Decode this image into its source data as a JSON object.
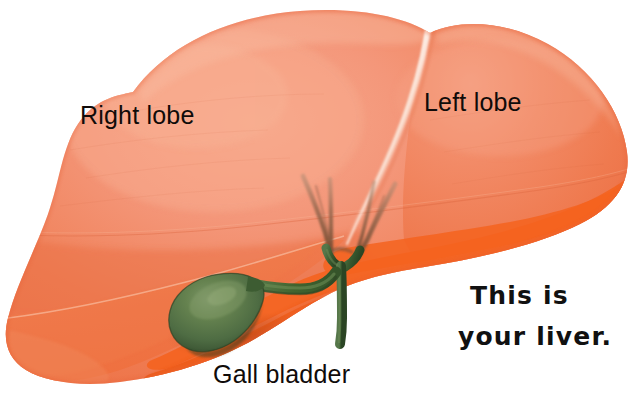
{
  "illustration": {
    "subject": "human liver anatomy",
    "background_color": "#ffffff",
    "labels": {
      "right_lobe": "Right lobe",
      "left_lobe": "Left lobe",
      "gall_bladder": "Gall bladder"
    },
    "caption": {
      "line1": "This is",
      "line2": "your liver."
    },
    "colors": {
      "liver_light": "#f4977a",
      "liver_main": "#f0815a",
      "liver_mid": "#ef7347",
      "liver_shadow": "#e56840",
      "liver_underside": "#f4631f",
      "liver_underside_dark": "#ea5c1c",
      "gallbladder_green": "#4e6c43",
      "gallbladder_highlight": "#74905f",
      "gallbladder_dark": "#31472c",
      "duct_green": "#39582f",
      "duct_green_light": "#4f7040",
      "vessel_brown": "#9a6a50",
      "vessel_brown_dark": "#7d5340",
      "falciform_white": "#f7e2d6",
      "text_dark": "#100b09",
      "caption_black": "#111111"
    }
  }
}
